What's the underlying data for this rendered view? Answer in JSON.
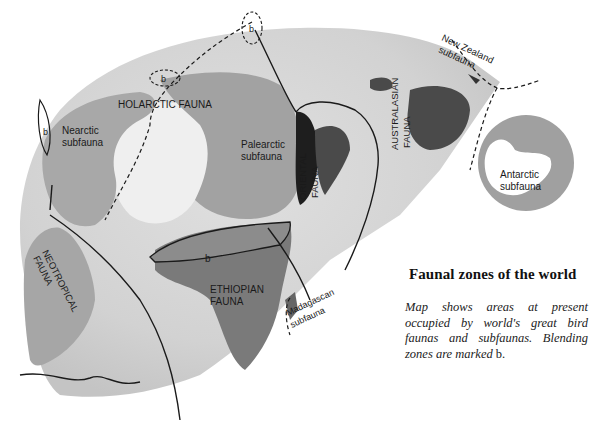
{
  "title": "Faunal zones of the world",
  "caption": {
    "text": "Map shows areas at present occupied by world's great bird faunas and subfaunas. Blending zones are marked",
    "marker": "b."
  },
  "regions": {
    "holarctic": "HOLARCTIC FAUNA",
    "nearctic_line1": "Nearctic",
    "nearctic_line2": "subfauna",
    "palearctic_line1": "Palearctic",
    "palearctic_line2": "subfauna",
    "oriental_line1": "ORIENTAL",
    "oriental_line2": "FAUNA",
    "australasian_line1": "AUSTRALASIAN",
    "australasian_line2": "FAUNA",
    "new_zealand_line1": "New Zealand",
    "new_zealand_line2": "subfauna",
    "antarctic_line1": "Antarctic",
    "antarctic_line2": "subfauna",
    "neotropical_line1": "NEOTROPICAL",
    "neotropical_line2": "FAUNA",
    "ethiopian_line1": "ETHIOPIAN",
    "ethiopian_line2": "FAUNA",
    "madagascan_line1": "Madagascan",
    "madagascan_line2": "subfauna"
  },
  "blend_marker": "b",
  "colors": {
    "ocean": "#d6d6d6",
    "land_light": "#ececec",
    "land_mid": "#9a9a9a",
    "land_dark": "#6e6e6e",
    "oriental": "#222222",
    "australasian": "#4a4a4a",
    "boundary": "#1a1a1a"
  }
}
